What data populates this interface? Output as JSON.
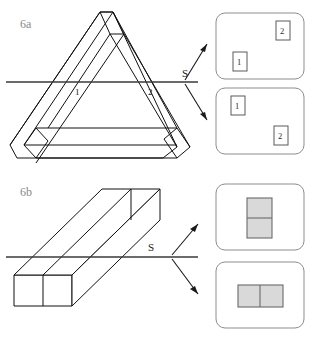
{
  "figure": {
    "title_visible": false,
    "background_color": "#ffffff",
    "ink_color": "#111111",
    "label_gray": "#8a8a8a",
    "cross_section_fill": "#d9d9d9",
    "card_border": "#8d8d8d"
  },
  "panels": [
    {
      "id": "6a",
      "label": "6a",
      "object_name": "penrose-impossible-triangle",
      "section_plane_label": "S",
      "edge_labels": [
        {
          "text": "1",
          "x": 75,
          "y": 94
        },
        {
          "text": "2",
          "x": 148,
          "y": 94
        }
      ],
      "results": [
        {
          "id": "6a-result-top",
          "items": [
            {
              "text": "2",
              "position": "top-right"
            },
            {
              "text": "1",
              "position": "bottom-left"
            }
          ]
        },
        {
          "id": "6a-result-bottom",
          "items": [
            {
              "text": "1",
              "position": "top-left"
            },
            {
              "text": "2",
              "position": "bottom-right"
            }
          ]
        }
      ]
    },
    {
      "id": "6b",
      "label": "6b",
      "object_name": "rectangular-prism-beam",
      "section_plane_label": "S",
      "edge_labels": [],
      "results": [
        {
          "id": "6b-result-top",
          "orientation": "vertical",
          "cells": 2,
          "fill": "#d9d9d9"
        },
        {
          "id": "6b-result-bottom",
          "orientation": "horizontal",
          "cells": 2,
          "fill": "#d9d9d9"
        }
      ]
    }
  ],
  "annotations": {
    "arrow_count_per_panel": 2,
    "arrow_directions": [
      "up-right",
      "down-right"
    ]
  }
}
